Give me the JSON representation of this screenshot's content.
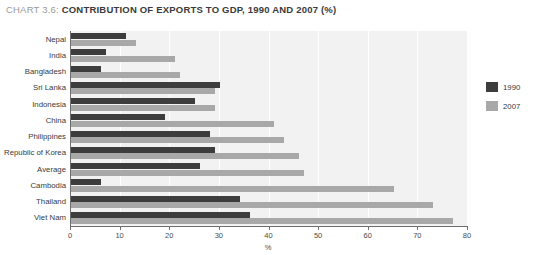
{
  "title": {
    "prefix": "CHART 3.6:",
    "main": "CONTRIBUTION OF EXPORTS TO GDP, 1990 AND 2007 (%)"
  },
  "legend": {
    "items": [
      {
        "label": "1990",
        "color": "#3d3d3d"
      },
      {
        "label": "2007",
        "color": "#a8a8a8"
      }
    ]
  },
  "axis": {
    "x_title": "%",
    "ticks": [
      "0",
      "10",
      "20",
      "30",
      "40",
      "50",
      "60",
      "70",
      "80"
    ]
  },
  "chart_data": {
    "type": "bar",
    "orientation": "horizontal",
    "title": "CHART 3.6: CONTRIBUTION OF EXPORTS TO GDP, 1990 AND 2007 (%)",
    "xlabel": "%",
    "ylabel": "",
    "xlim": [
      0,
      80
    ],
    "xticks": [
      0,
      10,
      20,
      30,
      40,
      50,
      60,
      70,
      80
    ],
    "grid": true,
    "legend_position": "right",
    "categories": [
      "Nepal",
      "India",
      "Bangladesh",
      "Sri Lanka",
      "Indonesia",
      "China",
      "Philippines",
      "Republic of Korea",
      "Average",
      "Cambodia",
      "Thailand",
      "Viet Nam"
    ],
    "series": [
      {
        "name": "1990",
        "color": "#3d3d3d",
        "values": [
          11,
          7,
          6,
          30,
          25,
          19,
          28,
          29,
          26,
          6,
          34,
          36
        ]
      },
      {
        "name": "2007",
        "color": "#a8a8a8",
        "values": [
          13,
          21,
          22,
          29,
          29,
          41,
          43,
          46,
          47,
          65,
          73,
          77
        ]
      }
    ]
  }
}
